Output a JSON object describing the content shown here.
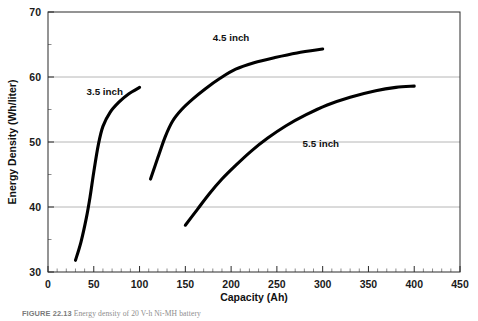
{
  "figure": {
    "caption_number": "FIGURE 22.13",
    "caption_text": "Energy density of 20 V-h Ni-MH battery"
  },
  "chart_data": {
    "type": "line",
    "title": "",
    "xlabel": "Capacity (Ah)",
    "ylabel": "Energy Density (Wh/liter)",
    "xlim": [
      0,
      450
    ],
    "ylim": [
      30,
      70
    ],
    "xticks": [
      0,
      50,
      100,
      150,
      200,
      250,
      300,
      350,
      400,
      450
    ],
    "xtick_labels": [
      "0",
      "50",
      "100",
      "150",
      "200",
      "250",
      "300",
      "350",
      "400",
      "450"
    ],
    "yticks": [
      30,
      40,
      50,
      60,
      70
    ],
    "ytick_labels": [
      "30",
      "40",
      "50",
      "60",
      "70"
    ],
    "x_minor_step": 10,
    "y_minor_step": 5,
    "grid": "horizontal-major",
    "grid_color": "#b6b6b6",
    "legend": "inline-annotations",
    "series": [
      {
        "name": "3.5 inch",
        "label": "3.5 inch",
        "color": "#000000",
        "label_x": 62,
        "label_y": 57.2,
        "points": [
          [
            30,
            31.8
          ],
          [
            36,
            34.6
          ],
          [
            42,
            38.4
          ],
          [
            46,
            41.6
          ],
          [
            50,
            45.4
          ],
          [
            55,
            49.6
          ],
          [
            60,
            52.4
          ],
          [
            68,
            54.6
          ],
          [
            78,
            56.2
          ],
          [
            88,
            57.4
          ],
          [
            100,
            58.4
          ]
        ]
      },
      {
        "name": "4.5 inch",
        "label": "4.5 inch",
        "color": "#000000",
        "label_x": 200,
        "label_y": 65.6,
        "points": [
          [
            112,
            44.3
          ],
          [
            120,
            47.6
          ],
          [
            128,
            50.8
          ],
          [
            136,
            53.2
          ],
          [
            146,
            55.0
          ],
          [
            158,
            56.6
          ],
          [
            172,
            58.2
          ],
          [
            188,
            59.8
          ],
          [
            205,
            61.2
          ],
          [
            225,
            62.2
          ],
          [
            248,
            63.0
          ],
          [
            272,
            63.7
          ],
          [
            300,
            64.3
          ]
        ]
      },
      {
        "name": "5.5 inch",
        "label": "5.5 inch",
        "color": "#000000",
        "label_x": 298,
        "label_y": 49.3,
        "points": [
          [
            150,
            37.2
          ],
          [
            163,
            39.6
          ],
          [
            176,
            42.0
          ],
          [
            190,
            44.3
          ],
          [
            205,
            46.4
          ],
          [
            222,
            48.6
          ],
          [
            240,
            50.6
          ],
          [
            260,
            52.5
          ],
          [
            282,
            54.2
          ],
          [
            305,
            55.7
          ],
          [
            330,
            56.9
          ],
          [
            358,
            57.9
          ],
          [
            380,
            58.4
          ],
          [
            400,
            58.6
          ]
        ]
      }
    ]
  }
}
